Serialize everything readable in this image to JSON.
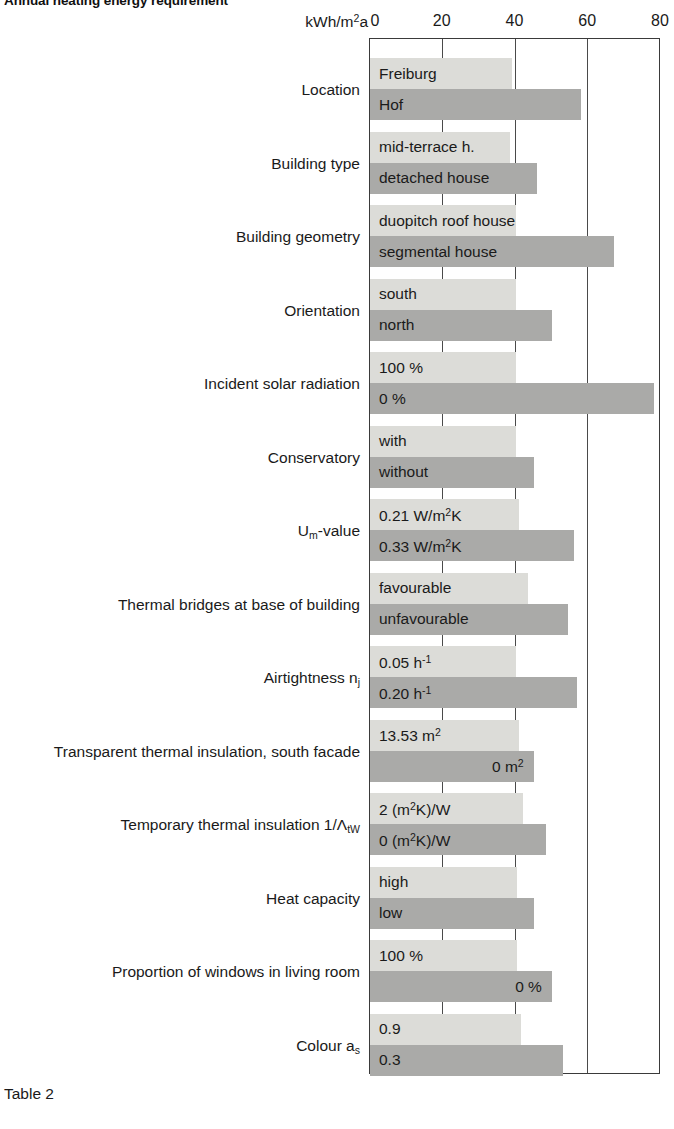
{
  "title": "Annual heating energy requirement",
  "caption": "Table 2",
  "axis": {
    "unit_label": "kWh/m2a",
    "unit_label_parts": {
      "prefix": "kWh/m",
      "exponent": "2",
      "suffix": "a"
    },
    "ticks": [
      "0",
      "20",
      "40",
      "60",
      "80"
    ]
  },
  "colors": {
    "bar_light": "#dcdcd8",
    "bar_dark": "#aaaaa8",
    "frame": "#3a3a3a",
    "text": "#1a1a1a",
    "background": "#ffffff"
  },
  "chart_data": {
    "type": "bar",
    "orientation": "horizontal",
    "title": "Annual heating energy requirement",
    "xlabel": "kWh/m2a",
    "ylabel": "",
    "xlim": [
      0,
      80
    ],
    "xticks": [
      0,
      20,
      40,
      60,
      80
    ],
    "grid": true,
    "legend": "none",
    "categories": [
      "Location",
      "Building type",
      "Building geometry",
      "Orientation",
      "Incident solar radiation",
      "Conservatory",
      "Um-value",
      "Thermal bridges at base of building",
      "Airtightness nj",
      "Transparent thermal insulation, south facade",
      "Temporary thermal insulation 1/LtW",
      "Heat capacity",
      "Proportion of windows in living room",
      "Colour as"
    ],
    "series": [
      {
        "name": "variant A (light)",
        "values": [
          39,
          38.5,
          40,
          40,
          40,
          40,
          41,
          43.5,
          40,
          41,
          42,
          40.5,
          40.5,
          41.5
        ]
      },
      {
        "name": "variant B (dark)",
        "values": [
          58,
          46,
          67,
          50,
          78,
          45,
          56,
          54.5,
          57,
          45,
          48.5,
          45,
          50,
          53
        ]
      }
    ]
  },
  "rows": [
    {
      "category": "Location",
      "bars": [
        {
          "label": "Freiburg",
          "value": 39,
          "shade": "light",
          "align": "left"
        },
        {
          "label": "Hof",
          "value": 58,
          "shade": "dark",
          "align": "left"
        }
      ]
    },
    {
      "category": "Building type",
      "bars": [
        {
          "label": "mid-terrace h.",
          "value": 38.5,
          "shade": "light",
          "align": "left"
        },
        {
          "label": "detached house",
          "value": 46,
          "shade": "dark",
          "align": "left"
        }
      ]
    },
    {
      "category": "Building geometry",
      "bars": [
        {
          "label": "duopitch roof house",
          "value": 40,
          "shade": "light",
          "align": "left"
        },
        {
          "label": "segmental house",
          "value": 67,
          "shade": "dark",
          "align": "left"
        }
      ]
    },
    {
      "category": "Orientation",
      "bars": [
        {
          "label": "south",
          "value": 40,
          "shade": "light",
          "align": "left"
        },
        {
          "label": "north",
          "value": 50,
          "shade": "dark",
          "align": "left"
        }
      ]
    },
    {
      "category": "Incident solar radiation",
      "bars": [
        {
          "label": "100 %",
          "value": 40,
          "shade": "light",
          "align": "left"
        },
        {
          "label": "0 %",
          "value": 78,
          "shade": "dark",
          "align": "left"
        }
      ]
    },
    {
      "category": "Conservatory",
      "bars": [
        {
          "label": "with",
          "value": 40,
          "shade": "light",
          "align": "left"
        },
        {
          "label": "without",
          "value": 45,
          "shade": "dark",
          "align": "left"
        }
      ]
    },
    {
      "category": "Um-value",
      "bars": [
        {
          "label": "0.21 W/m2K",
          "value": 41,
          "shade": "light",
          "align": "left"
        },
        {
          "label": "0.33 W/m2K",
          "value": 56,
          "shade": "dark",
          "align": "left"
        }
      ]
    },
    {
      "category": "Thermal bridges at base of building",
      "bars": [
        {
          "label": "favourable",
          "value": 43.5,
          "shade": "light",
          "align": "left"
        },
        {
          "label": "unfavourable",
          "value": 54.5,
          "shade": "dark",
          "align": "left"
        }
      ]
    },
    {
      "category": "Airtightness nj",
      "bars": [
        {
          "label": "0.05 h-1",
          "value": 40,
          "shade": "light",
          "align": "left"
        },
        {
          "label": "0.20 h-1",
          "value": 57,
          "shade": "dark",
          "align": "left"
        }
      ]
    },
    {
      "category": "Transparent thermal insulation, south facade",
      "bars": [
        {
          "label": "13.53 m2",
          "value": 41,
          "shade": "light",
          "align": "left"
        },
        {
          "label": "0 m2",
          "value": 45,
          "shade": "dark",
          "align": "right"
        }
      ]
    },
    {
      "category": "Temporary thermal insulation 1/LtW",
      "bars": [
        {
          "label": "2 (m2K)/W",
          "value": 42,
          "shade": "light",
          "align": "left"
        },
        {
          "label": "0 (m2K)/W",
          "value": 48.5,
          "shade": "dark",
          "align": "left"
        }
      ]
    },
    {
      "category": "Heat capacity",
      "bars": [
        {
          "label": "high",
          "value": 40.5,
          "shade": "light",
          "align": "left"
        },
        {
          "label": "low",
          "value": 45,
          "shade": "dark",
          "align": "left"
        }
      ]
    },
    {
      "category": "Proportion of windows in living room",
      "bars": [
        {
          "label": "100 %",
          "value": 40.5,
          "shade": "light",
          "align": "left"
        },
        {
          "label": "0 %",
          "value": 50,
          "shade": "dark",
          "align": "right"
        }
      ]
    },
    {
      "category": "Colour as",
      "bars": [
        {
          "label": "0.9",
          "value": 41.5,
          "shade": "light",
          "align": "left"
        },
        {
          "label": "0.3",
          "value": 53,
          "shade": "dark",
          "align": "left"
        }
      ]
    }
  ]
}
